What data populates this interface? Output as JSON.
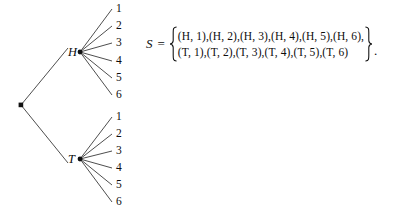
{
  "figure": {
    "tree": {
      "root_label": "",
      "branches": [
        {
          "node_label": "H",
          "leaves": [
            "1",
            "2",
            "3",
            "4",
            "5",
            "6"
          ]
        },
        {
          "node_label": "T",
          "leaves": [
            "1",
            "2",
            "3",
            "4",
            "5",
            "6"
          ]
        }
      ]
    },
    "set_expression": {
      "variable": "S",
      "equals": "=",
      "open_brace": "{",
      "close_brace": "}",
      "rows": [
        "(H, 1),(H, 2),(H, 3),(H, 4),(H, 5),(H, 6),",
        "(T, 1),(T, 2),(T, 3),(T, 4),(T, 5),(T, 6)"
      ],
      "terminator": "."
    },
    "colors": {
      "ink": "#0d0d0d",
      "line": "#3a3a3a",
      "background": "#ffffff"
    }
  }
}
